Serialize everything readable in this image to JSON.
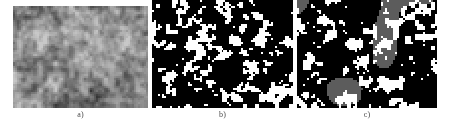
{
  "figure": {
    "type": "multi-panel-micrograph-figure",
    "background_color": "#ffffff",
    "width": 450,
    "height": 130,
    "panel_count": 3
  },
  "panels": [
    {
      "id": "a",
      "caption": "a)",
      "title": "Original grayscale micrograph",
      "kind": "grayscale-texture",
      "x": 13,
      "y": 6,
      "w": 135,
      "h": 102,
      "palette": [
        "#2e2e2e",
        "#4a4a4a",
        "#5e5e5e",
        "#747474",
        "#8a8a8a",
        "#9e9e9e",
        "#b4b4b4",
        "#c8c8c8"
      ],
      "mean_gray": "#787878",
      "grain": 2,
      "seed": 1733,
      "blur": 0.6
    },
    {
      "id": "b",
      "caption": "b)",
      "title": "Binary threshold segmentation",
      "kind": "binary-segmentation",
      "x": 152,
      "y": 0,
      "w": 141,
      "h": 108,
      "palette": [
        "#000000",
        "#ffffff"
      ],
      "background_color": "#000000",
      "foreground_color": "#ffffff",
      "phase_fraction_white": 0.27,
      "grain": 2,
      "seed": 4471,
      "blob_count": 520
    },
    {
      "id": "c",
      "caption": "c)",
      "title": "Three-phase segmentation",
      "kind": "ternary-segmentation",
      "x": 297,
      "y": 0,
      "w": 140,
      "h": 108,
      "palette": [
        "#000000",
        "#5c5c5c",
        "#ffffff"
      ],
      "background_color": "#000000",
      "intermediate_color": "#5c5c5c",
      "foreground_color": "#ffffff",
      "phase_fraction_white": 0.22,
      "phase_fraction_gray": 0.17,
      "grain": 2,
      "seed": 8812,
      "blob_count": 460
    }
  ],
  "captions": {
    "a": "a)",
    "b": "b)",
    "c": "c)"
  },
  "chart_data": {
    "type": "heatmap",
    "title": "",
    "xlabel": "",
    "ylabel": "",
    "grid": false,
    "legend": "none",
    "panels": [
      {
        "label": "a)",
        "description": "Continuous-tone grayscale micrograph showing a granular microstructure",
        "levels": 256,
        "level_labels": [
          "dark matrix",
          "mid gray grains",
          "bright highlights"
        ],
        "level_values": [
          0.32,
          0.47,
          0.21
        ]
      },
      {
        "label": "b)",
        "description": "Two-level (binary) segmentation of panel a) separating particles from matrix",
        "levels": 2,
        "level_labels": [
          "black (matrix)",
          "white (particles)"
        ],
        "level_values": [
          0.73,
          0.27
        ]
      },
      {
        "label": "c)",
        "description": "Three-level segmentation of panel a) separating matrix, intermediate phase and particles",
        "levels": 3,
        "level_labels": [
          "black (matrix)",
          "gray (intermediate phase)",
          "white (particles)"
        ],
        "level_values": [
          0.61,
          0.17,
          0.22
        ]
      }
    ]
  }
}
